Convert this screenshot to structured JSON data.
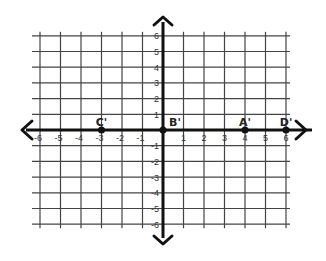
{
  "diagram": {
    "type": "coordinate-plane",
    "x_range": [
      -6,
      6
    ],
    "y_range": [
      -6,
      6
    ],
    "grid_color": "#444444",
    "axis_color": "#111111",
    "x_ticks": [
      "-6",
      "-5",
      "-4",
      "-3",
      "-2",
      "-1",
      "1",
      "2",
      "3",
      "4",
      "5",
      "6"
    ],
    "y_ticks": [
      "6",
      "5",
      "4",
      "3",
      "2",
      "1",
      "-1",
      "-2",
      "-3",
      "-4",
      "-5",
      "-6"
    ],
    "points": [
      {
        "label": "C'",
        "x": -3,
        "y": 0
      },
      {
        "label": "B'",
        "x": 0,
        "y": 0
      },
      {
        "label": "A'",
        "x": 4,
        "y": 0
      },
      {
        "label": "D'",
        "x": 6,
        "y": 0
      }
    ]
  }
}
